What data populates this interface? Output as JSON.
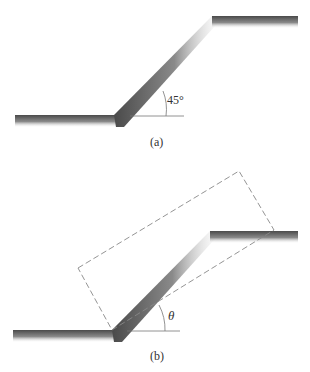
{
  "figure_a": {
    "caption": "(a)",
    "angle_label": "45°",
    "description": "Embankment slope cross-section at 45 degrees"
  },
  "figure_b": {
    "caption": "(b)",
    "angle_label": "θ",
    "description": "Slope with dashed rectangular sliding block inclined at angle theta"
  },
  "colors": {
    "ground_dark": "#555555",
    "ground_light": "#ffffff",
    "line": "#777777",
    "dash": "#888888"
  }
}
